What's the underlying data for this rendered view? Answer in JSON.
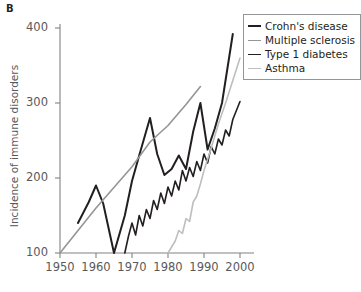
{
  "panel": {
    "label": "B"
  },
  "legend": {
    "position": "top-right",
    "entries": [
      {
        "label": "Crohn's disease",
        "color": "#231f20",
        "width": 2.0
      },
      {
        "label": "Multiple sclerosis",
        "color": "#939598",
        "width": 1.6
      },
      {
        "label": "Type 1 diabetes",
        "color": "#231f20",
        "width": 1.6
      },
      {
        "label": "Asthma",
        "color": "#bcbec0",
        "width": 1.6
      }
    ]
  },
  "axes": {
    "ylabel": "Incidence of immune disorders",
    "xlabel": "",
    "yticks": [
      100,
      200,
      300,
      400
    ],
    "xticks": [
      1950,
      1960,
      1970,
      1980,
      1990,
      2000
    ],
    "xlim": [
      1950,
      2000
    ],
    "ylim": [
      100,
      400
    ],
    "grid": false,
    "axis_color": "#808285"
  },
  "chart_data": {
    "type": "line",
    "title": "",
    "xlabel": "",
    "ylabel": "Incidence of immune disorders",
    "xlim": [
      1950,
      2000
    ],
    "ylim": [
      100,
      400
    ],
    "grid": false,
    "legend_position": "top-right",
    "series": [
      {
        "name": "Crohn's disease",
        "color": "#231f20",
        "width": 2.0,
        "points": [
          [
            1955,
            140
          ],
          [
            1958,
            168
          ],
          [
            1960,
            190
          ],
          [
            1962,
            166
          ],
          [
            1965,
            100
          ],
          [
            1968,
            150
          ],
          [
            1970,
            196
          ],
          [
            1972,
            230
          ],
          [
            1975,
            280
          ],
          [
            1977,
            232
          ],
          [
            1979,
            204
          ],
          [
            1981,
            212
          ],
          [
            1983,
            230
          ],
          [
            1985,
            212
          ],
          [
            1987,
            262
          ],
          [
            1989,
            300
          ],
          [
            1991,
            238
          ],
          [
            1993,
            266
          ],
          [
            1995,
            300
          ],
          [
            1998,
            392
          ]
        ]
      },
      {
        "name": "Multiple sclerosis",
        "color": "#939598",
        "width": 1.6,
        "points": [
          [
            1950,
            100
          ],
          [
            1960,
            160
          ],
          [
            1970,
            215
          ],
          [
            1975,
            248
          ],
          [
            1980,
            270
          ],
          [
            1985,
            298
          ],
          [
            1989,
            322
          ]
        ]
      },
      {
        "name": "Type 1 diabetes",
        "color": "#231f20",
        "width": 1.6,
        "points": [
          [
            1968,
            100
          ],
          [
            1969,
            122
          ],
          [
            1970,
            140
          ],
          [
            1971,
            124
          ],
          [
            1972,
            150
          ],
          [
            1973,
            136
          ],
          [
            1974,
            158
          ],
          [
            1975,
            146
          ],
          [
            1976,
            170
          ],
          [
            1977,
            158
          ],
          [
            1978,
            180
          ],
          [
            1979,
            166
          ],
          [
            1980,
            188
          ],
          [
            1981,
            176
          ],
          [
            1982,
            196
          ],
          [
            1983,
            184
          ],
          [
            1984,
            210
          ],
          [
            1985,
            196
          ],
          [
            1986,
            214
          ],
          [
            1987,
            202
          ],
          [
            1988,
            222
          ],
          [
            1989,
            210
          ],
          [
            1990,
            232
          ],
          [
            1991,
            220
          ],
          [
            1992,
            242
          ],
          [
            1993,
            232
          ],
          [
            1994,
            252
          ],
          [
            1995,
            244
          ],
          [
            1996,
            264
          ],
          [
            1997,
            256
          ],
          [
            1998,
            278
          ],
          [
            1999,
            290
          ],
          [
            2000,
            302
          ]
        ]
      },
      {
        "name": "Asthma",
        "color": "#bcbec0",
        "width": 1.6,
        "points": [
          [
            1980,
            100
          ],
          [
            1982,
            116
          ],
          [
            1983,
            130
          ],
          [
            1984,
            126
          ],
          [
            1985,
            146
          ],
          [
            1986,
            142
          ],
          [
            1987,
            168
          ],
          [
            1988,
            176
          ],
          [
            1989,
            192
          ],
          [
            1990,
            210
          ],
          [
            1992,
            240
          ],
          [
            1994,
            272
          ],
          [
            1996,
            300
          ],
          [
            1998,
            330
          ],
          [
            2000,
            360
          ]
        ]
      }
    ]
  }
}
